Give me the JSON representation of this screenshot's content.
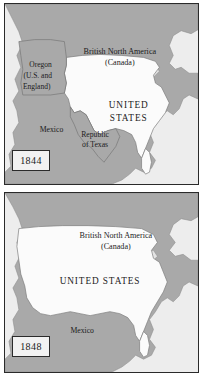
{
  "figure": {
    "land_color": "#a9a9a9",
    "united_states_color": "#fbfbfb",
    "ocean_color": "#ededed",
    "border_color": "#2a2a2a"
  },
  "panels": [
    {
      "id": "1844",
      "year": "1844",
      "labels": {
        "canada": [
          "British North America",
          "(Canada)"
        ],
        "oregon": [
          "Oregon",
          "(U.S. and",
          "England)"
        ],
        "united_states": [
          "UNITED",
          "STATES"
        ],
        "mexico": "Mexico",
        "texas": [
          "Republic",
          "of Texas"
        ]
      }
    },
    {
      "id": "1848",
      "year": "1848",
      "labels": {
        "canada": [
          "British North America",
          "(Canada)"
        ],
        "united_states": "UNITED STATES",
        "mexico": "Mexico"
      }
    }
  ]
}
